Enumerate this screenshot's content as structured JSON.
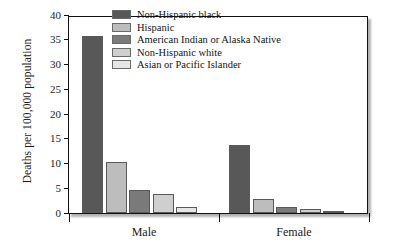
{
  "chart_data": {
    "type": "bar",
    "title": "",
    "xlabel": "",
    "ylabel": "Deaths per 100,000 population",
    "categories": [
      "Male",
      "Female"
    ],
    "ylim": [
      0,
      40
    ],
    "yticks": [
      0,
      5,
      10,
      15,
      20,
      25,
      30,
      35,
      40
    ],
    "ytick_labels": [
      "0",
      "5",
      "10",
      "15",
      "20",
      "25",
      "30",
      "35",
      "40"
    ],
    "grid": false,
    "legend_position": "top-center-right",
    "series": [
      {
        "name": "Non-Hispanic black",
        "color": "#585858",
        "values": [
          35.7,
          13.8
        ]
      },
      {
        "name": "Hispanic",
        "color": "#bdbdbd",
        "values": [
          10.4,
          2.9
        ]
      },
      {
        "name": "American Indian or Alaska Native",
        "color": "#7a7a7a",
        "values": [
          4.6,
          1.3
        ]
      },
      {
        "name": "Non-Hispanic white",
        "color": "#cfcfcf",
        "values": [
          3.9,
          0.9
        ]
      },
      {
        "name": "Asian or Pacific Islander",
        "color": "#e6e6e6",
        "values": [
          1.3,
          0.4
        ]
      }
    ]
  }
}
